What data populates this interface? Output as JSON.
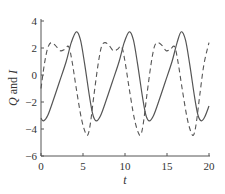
{
  "chart_data": {
    "type": "line",
    "title": "",
    "xlabel": "t",
    "ylabel": "Q and I",
    "xlim": [
      0,
      20
    ],
    "ylim": [
      -6,
      4
    ],
    "xticks": [
      0,
      5,
      10,
      15,
      20
    ],
    "yticks": [
      -6,
      -4,
      -2,
      0,
      2,
      4
    ],
    "xtick_labels": [
      "0",
      "5",
      "10",
      "15",
      "20"
    ],
    "ytick_labels": [
      "−6",
      "−4",
      "−2",
      "0",
      "2",
      "4"
    ],
    "grid": false,
    "legend": null,
    "series": [
      {
        "name": "Q",
        "style": "solid",
        "color": "#555555",
        "x": [
          0,
          0.3,
          0.8,
          1.5,
          2.2,
          3.0,
          3.6,
          4.2,
          4.7,
          5.2,
          5.8,
          6.2,
          6.6,
          7.1,
          7.8,
          8.5,
          9.3,
          9.9,
          10.5,
          11.0,
          11.5,
          12.1,
          12.5,
          12.9,
          13.4,
          14.1,
          14.8,
          15.6,
          16.2,
          16.7,
          17.2,
          17.7,
          18.3,
          18.7,
          19.1,
          19.5,
          20.0
        ],
        "y": [
          -3.2,
          -3.4,
          -3.0,
          -1.8,
          -0.5,
          1.0,
          2.4,
          3.2,
          2.6,
          0.8,
          -1.7,
          -3.0,
          -3.4,
          -3.0,
          -1.8,
          -0.5,
          1.0,
          2.4,
          3.2,
          2.6,
          0.8,
          -1.7,
          -3.0,
          -3.4,
          -3.0,
          -1.8,
          -0.5,
          1.0,
          2.4,
          3.2,
          2.6,
          0.8,
          -1.7,
          -3.0,
          -3.4,
          -3.1,
          -2.3
        ]
      },
      {
        "name": "I",
        "style": "dashed",
        "color": "#555555",
        "x": [
          0,
          0.4,
          0.8,
          1.2,
          1.7,
          2.3,
          2.8,
          3.3,
          3.7,
          4.2,
          4.8,
          5.3,
          5.6,
          5.9,
          6.3,
          6.8,
          7.2,
          7.6,
          8.1,
          8.6,
          9.1,
          9.6,
          10.0,
          10.5,
          11.1,
          11.6,
          11.9,
          12.2,
          12.6,
          13.1,
          13.5,
          13.9,
          14.4,
          14.9,
          15.4,
          15.9,
          16.3,
          16.8,
          17.4,
          17.9,
          18.2,
          18.5,
          18.9,
          19.4,
          20.0
        ],
        "y": [
          -1.0,
          0.8,
          2.0,
          2.4,
          2.2,
          1.8,
          1.9,
          2.1,
          1.0,
          -1.0,
          -3.2,
          -4.3,
          -4.4,
          -3.5,
          -1.5,
          0.8,
          2.1,
          2.4,
          2.2,
          1.8,
          1.9,
          2.1,
          1.0,
          -1.0,
          -3.2,
          -4.3,
          -4.4,
          -3.5,
          -1.5,
          0.8,
          2.1,
          2.4,
          2.2,
          1.8,
          1.9,
          2.1,
          1.0,
          -1.0,
          -3.2,
          -4.3,
          -4.4,
          -3.5,
          -1.5,
          0.8,
          2.4
        ]
      }
    ]
  },
  "axes": {
    "xlabel": "t",
    "ylabel": "Q and I"
  }
}
